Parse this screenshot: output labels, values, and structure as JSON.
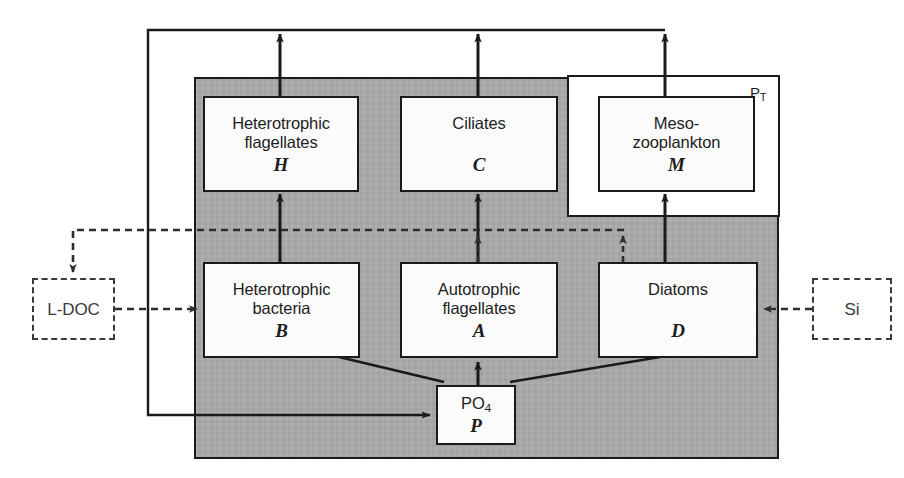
{
  "diagram": {
    "colors": {
      "shaded_region": "#a8a8a8",
      "node_fill": "#fbfbfb",
      "line": "#1a1a1a",
      "dashed_line": "#3a3a3a"
    },
    "outer_label": {
      "text": "P",
      "subscript": "T"
    },
    "nodes": [
      {
        "id": "H",
        "name": "heterotrophic-flagellates",
        "line1": "Heterotrophic",
        "line2": "flagellates",
        "symbol": "H",
        "style": "solid"
      },
      {
        "id": "C",
        "name": "ciliates",
        "line1": "Ciliates",
        "line2": "",
        "symbol": "C",
        "style": "solid"
      },
      {
        "id": "M",
        "name": "mesozooplankton",
        "line1": "Meso-",
        "line2": "zooplankton",
        "symbol": "M",
        "style": "solid"
      },
      {
        "id": "B",
        "name": "heterotrophic-bacteria",
        "line1": "Heterotrophic",
        "line2": "bacteria",
        "symbol": "B",
        "style": "solid"
      },
      {
        "id": "A",
        "name": "autotrophic-flagellates",
        "line1": "Autotrophic",
        "line2": "flagellates",
        "symbol": "A",
        "style": "solid"
      },
      {
        "id": "D",
        "name": "diatoms",
        "line1": "Diatoms",
        "line2": "",
        "symbol": "D",
        "style": "solid"
      },
      {
        "id": "P",
        "name": "phosphate",
        "line1": "PO",
        "line1_sub": "4",
        "line2": "",
        "symbol": "P",
        "style": "solid"
      },
      {
        "id": "LDOC",
        "name": "labile-dissolved-organic-carbon",
        "line1": "L-DOC",
        "line2": "",
        "symbol": "",
        "style": "dashed"
      },
      {
        "id": "SI",
        "name": "silicate",
        "line1": "Si",
        "line2": "",
        "symbol": "",
        "style": "dashed"
      }
    ],
    "flows": [
      {
        "from": "B",
        "to": "H",
        "style": "solid",
        "name": "flow-bacteria-to-heteroflagellates"
      },
      {
        "from": "A",
        "to": "C",
        "style": "solid",
        "name": "flow-autoflagellates-to-ciliates"
      },
      {
        "from": "D",
        "to": "M",
        "style": "solid",
        "name": "flow-diatoms-to-mesozooplankton"
      },
      {
        "from": "H",
        "to": "export",
        "style": "solid",
        "name": "flow-heteroflagellates-to-export"
      },
      {
        "from": "C",
        "to": "export",
        "style": "solid",
        "name": "flow-ciliates-to-export"
      },
      {
        "from": "M",
        "to": "export",
        "style": "solid",
        "name": "flow-mesozooplankton-to-export"
      },
      {
        "from": "export",
        "to": "P",
        "style": "solid",
        "name": "flow-recycling-to-phosphate"
      },
      {
        "from": "P",
        "to": "B",
        "style": "solid",
        "name": "flow-phosphate-to-bacteria"
      },
      {
        "from": "P",
        "to": "A",
        "style": "solid",
        "name": "flow-phosphate-to-autoflagellates"
      },
      {
        "from": "P",
        "to": "D",
        "style": "solid",
        "name": "flow-phosphate-to-diatoms"
      },
      {
        "from": "A",
        "to": "LDOC",
        "style": "dashed",
        "name": "flow-autoflagellates-to-ldoc"
      },
      {
        "from": "D",
        "to": "LDOC",
        "style": "dashed",
        "name": "flow-diatoms-to-ldoc"
      },
      {
        "from": "LDOC",
        "to": "B",
        "style": "dashed",
        "name": "flow-ldoc-to-bacteria"
      },
      {
        "from": "SI",
        "to": "D",
        "style": "dashed",
        "name": "flow-silicate-to-diatoms"
      }
    ]
  }
}
